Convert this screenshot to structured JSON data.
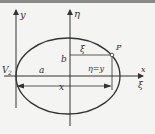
{
  "diagram": {
    "type": "ellipse-coordinate-diagram",
    "axes": {
      "y_axis_label": "y",
      "eta_axis_label": "η",
      "x_axis_label": "x",
      "xi_axis_label": "ξ"
    },
    "labels": {
      "vertex": "V",
      "vertex_subscript": "2",
      "semi_major": "a",
      "semi_minor": "b",
      "xi_segment": "ξ",
      "point": "P",
      "eta_eq_y": "η=y",
      "x_dimension": "x"
    },
    "colors": {
      "line": "#333333",
      "background": "#f4f4f2",
      "top_band": "#8a8a88"
    }
  }
}
